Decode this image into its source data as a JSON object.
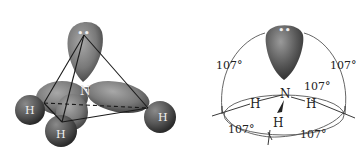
{
  "figure": {
    "left_panel": {
      "description": "3D space-filling model of ammonia with tetrahedral outline",
      "central_atom": "N",
      "hydrogens": [
        "H",
        "H",
        "H"
      ],
      "lone_pair_marker": "••"
    },
    "right_panel": {
      "description": "Bond-angle schematic of ammonia",
      "central_atom": "N",
      "hydrogens": [
        "H",
        "H",
        "H"
      ],
      "lone_pair_marker": "••",
      "angle_labels": [
        "107°",
        "107°",
        "107°",
        "107°",
        "107°",
        "107°"
      ]
    },
    "colors": {
      "lobe": "#7a7a7a",
      "lobe_dark": "#3d3d3d",
      "sphere": "#5c5c5c",
      "line": "#1a1a1a",
      "arc": "#555555"
    }
  }
}
